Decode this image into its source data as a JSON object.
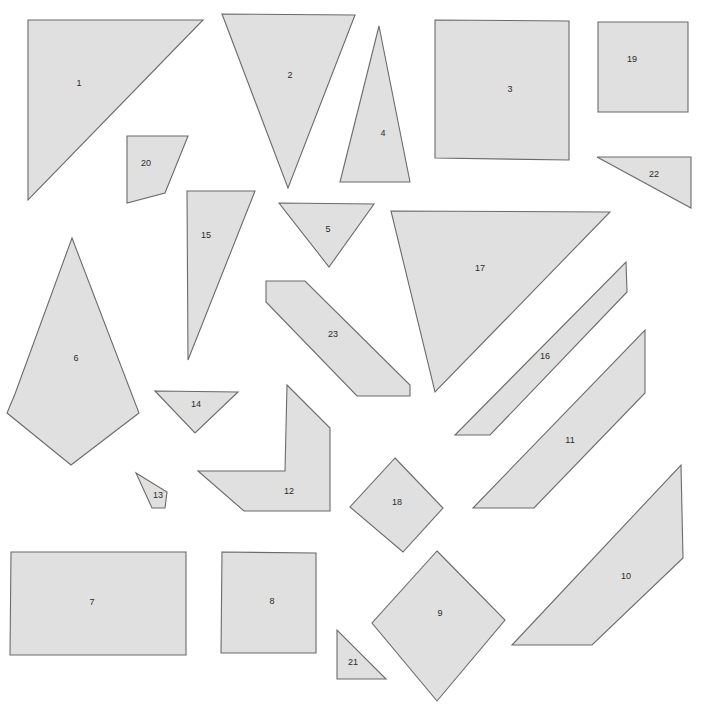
{
  "page": {
    "background_color": "#ffffff",
    "width": 702,
    "height": 707
  },
  "style": {
    "shape_fill": "#e0e0e0",
    "shape_stroke": "#6b6b6b",
    "label_color": "#2b2b2b"
  },
  "shapes": [
    {
      "label": "1",
      "kind": "triangle",
      "points": "28,20 203,20 28,200",
      "label_x": 79,
      "label_y": 84
    },
    {
      "label": "2",
      "kind": "triangle",
      "points": "222,14 355,15 288,188",
      "label_x": 290,
      "label_y": 76
    },
    {
      "label": "3",
      "kind": "square",
      "points": "435,20 569,21 569,160 435,158",
      "label_x": 510,
      "label_y": 90
    },
    {
      "label": "4",
      "kind": "triangle",
      "points": "379,26 410,182 340,182",
      "label_x": 383,
      "label_y": 134
    },
    {
      "label": "5",
      "kind": "triangle",
      "points": "279,203 374,204 329,267",
      "label_x": 328,
      "label_y": 230
    },
    {
      "label": "6",
      "kind": "pentagon",
      "points": "72,238 139,413 71,465 7,413 15,394",
      "label_x": 76,
      "label_y": 359
    },
    {
      "label": "7",
      "kind": "rectangle",
      "points": "11,552 186,552 186,655 10,655",
      "label_x": 92,
      "label_y": 603
    },
    {
      "label": "8",
      "kind": "square",
      "points": "222,552 316,553 316,653 221,653",
      "label_x": 272,
      "label_y": 602
    },
    {
      "label": "9",
      "kind": "diamond",
      "points": "437,551 505,620 437,701 372,623",
      "label_x": 440,
      "label_y": 614
    },
    {
      "label": "10",
      "kind": "parallelogram",
      "points": "681,465 683,558 592,645 512,645",
      "label_x": 626,
      "label_y": 577
    },
    {
      "label": "11",
      "kind": "parallelogram",
      "points": "645,330 645,393 534,508 473,508",
      "label_x": 570,
      "label_y": 441
    },
    {
      "label": "12",
      "kind": "L-shape",
      "points": "287,385 330,428 330,511 244,511 198,471 285,471",
      "label_x": 289,
      "label_y": 492
    },
    {
      "label": "13",
      "kind": "quadrilateral",
      "points": "136,473 167,492 165,508 152,508",
      "label_x": 158,
      "label_y": 496
    },
    {
      "label": "14",
      "kind": "triangle",
      "points": "155,391 238,392 195,433",
      "label_x": 196,
      "label_y": 405
    },
    {
      "label": "15",
      "kind": "triangle",
      "points": "187,191 255,191 188,360",
      "label_x": 206,
      "label_y": 236
    },
    {
      "label": "16",
      "kind": "parallelogram",
      "points": "626,262 627,292 490,435 455,435",
      "label_x": 545,
      "label_y": 357
    },
    {
      "label": "17",
      "kind": "triangle",
      "points": "391,211 610,212 435,392",
      "label_x": 480,
      "label_y": 269
    },
    {
      "label": "18",
      "kind": "diamond",
      "points": "395,458 443,508 403,552 350,507",
      "label_x": 397,
      "label_y": 503
    },
    {
      "label": "19",
      "kind": "square",
      "points": "598,22 688,22 688,112 598,112",
      "label_x": 632,
      "label_y": 60
    },
    {
      "label": "20",
      "kind": "quadrilateral",
      "points": "127,136 188,136 165,193 127,203",
      "label_x": 146,
      "label_y": 164
    },
    {
      "label": "21",
      "kind": "triangle",
      "points": "337,630 337,679 386,679",
      "label_x": 353,
      "label_y": 663
    },
    {
      "label": "22",
      "kind": "triangle",
      "points": "597,157 691,157 691,208",
      "label_x": 654,
      "label_y": 175
    },
    {
      "label": "23",
      "kind": "strip",
      "points": "266,281 305,281 410,385 410,396 357,396 266,302",
      "label_x": 333,
      "label_y": 335
    }
  ]
}
